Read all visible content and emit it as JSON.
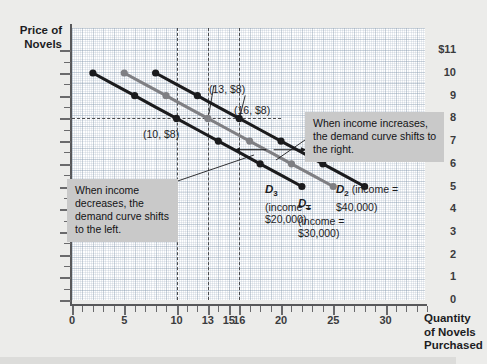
{
  "chart_data": {
    "type": "line",
    "title": "",
    "xlabel": "Quantity of Novels Purchased",
    "ylabel": "Price of Novels",
    "xlim": [
      0,
      33
    ],
    "ylim": [
      0,
      11.6
    ],
    "grid": true,
    "legend": "none",
    "x_ticks": [
      0,
      5,
      10,
      13,
      15,
      16,
      20,
      25,
      30
    ],
    "y_ticks": [
      "0",
      "1",
      "2",
      "3",
      "4",
      "5",
      "6",
      "7",
      "8",
      "9",
      "10",
      "$11"
    ],
    "series": [
      {
        "name": "D3",
        "label": "D",
        "subscript": "3",
        "note": "(income = $20,000)",
        "color": "#1b1b1d",
        "x": [
          2,
          4,
          6,
          8,
          10,
          12,
          14,
          16,
          18,
          20,
          22
        ],
        "y": [
          10,
          9.5,
          9,
          8.5,
          8,
          7.5,
          7,
          6.5,
          6,
          5.5,
          5
        ],
        "markers_x": [
          2,
          6,
          10,
          14,
          18,
          22
        ],
        "markers_y": [
          10,
          9,
          8,
          7,
          6,
          5
        ]
      },
      {
        "name": "D1",
        "label": "D",
        "subscript": "1",
        "note": "(income = $30,000)",
        "color": "#7f7f83",
        "x": [
          5,
          7,
          9,
          11,
          13,
          15,
          17,
          19,
          21,
          23,
          25
        ],
        "y": [
          10,
          9.5,
          9,
          8.5,
          8,
          7.5,
          7,
          6.5,
          6,
          5.5,
          5
        ],
        "markers_x": [
          5,
          9,
          13,
          17,
          21,
          25
        ],
        "markers_y": [
          10,
          9,
          8,
          7,
          6,
          5
        ]
      },
      {
        "name": "D2",
        "label": "D",
        "subscript": "2",
        "note": "(income = $40,000)",
        "color": "#1b1b1d",
        "x": [
          8,
          10,
          12,
          14,
          16,
          18,
          20,
          22,
          24,
          26,
          28
        ],
        "y": [
          10,
          9.5,
          9,
          8.5,
          8,
          7.5,
          7,
          6.5,
          6,
          5.5,
          5
        ],
        "markers_x": [
          8,
          12,
          16,
          20,
          24,
          28
        ],
        "markers_y": [
          10,
          9,
          8,
          7,
          6,
          5
        ]
      }
    ],
    "annotations": [
      {
        "text": "(10, $8)",
        "x": 10,
        "y": 8
      },
      {
        "text": "(13, $8)",
        "x": 13,
        "y": 8
      },
      {
        "text": "(16, $8)",
        "x": 16,
        "y": 8
      }
    ],
    "reference_lines": {
      "horizontal": [
        8
      ],
      "vertical": [
        10,
        13,
        16
      ]
    }
  },
  "axes": {
    "y_title_line1": "Price of",
    "y_title_line2": "Novels",
    "x_title_line1": "Quantity",
    "x_title_line2": "of Novels",
    "x_title_line3": "Purchased"
  },
  "y_labels": [
    "$11",
    "10",
    "9",
    "8",
    "7",
    "6",
    "5",
    "4",
    "3",
    "2",
    "1",
    "0"
  ],
  "x_labels": [
    "0",
    "5",
    "10",
    "13",
    "15",
    "16",
    "20",
    "25",
    "30"
  ],
  "point_labels": {
    "p1": "(10, $8)",
    "p2": "(13, $8)",
    "p3": "(16, $8)"
  },
  "callouts": {
    "left": "When income decreases, the demand curve shifts to the left.",
    "right": "When income increases, the demand curve shifts to the right."
  },
  "curve_labels": {
    "d3_name": "D",
    "d3_sub": "3",
    "d3_note_line1": "(income =",
    "d3_note_line2": "$20,000)",
    "d1_name": "D",
    "d1_sub": "1",
    "d1_note_line1": "(income =",
    "d1_note_line2": "$30,000)",
    "d2_name": "D",
    "d2_sub": "2",
    "d2_note_line1": "(income =",
    "d2_note_line2": "$40,000)"
  },
  "colors": {
    "curve_dark": "#1b1b1d",
    "curve_gray": "#7f7f83",
    "callout_bg": "#c9c9c9",
    "page_bg": "#ececea",
    "plot_bg": "#ffffff"
  }
}
